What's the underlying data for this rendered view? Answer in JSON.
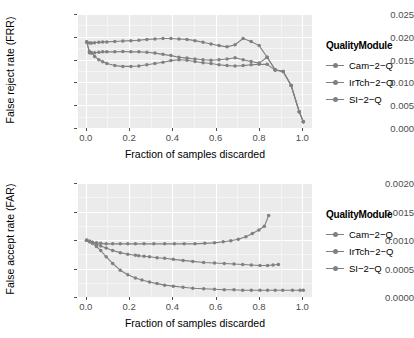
{
  "chart_data": [
    {
      "type": "line",
      "id": "frr-chart",
      "title": "",
      "xlabel": "Fraction of samples discarded",
      "ylabel": "False reject rate (FRR)",
      "xlim": [
        -0.04,
        1.04
      ],
      "ylim": [
        -0.0012,
        0.0262
      ],
      "xticks": [
        0.0,
        0.2,
        0.4,
        0.6,
        0.8,
        1.0
      ],
      "xticklabels": [
        "0.0",
        "0.2",
        "0.4",
        "0.6",
        "0.8",
        "1.0"
      ],
      "yticks": [
        0.0,
        0.005,
        0.01,
        0.015,
        0.02,
        0.025
      ],
      "yticklabels": [
        "0.000",
        "0.005",
        "0.010",
        "0.015",
        "0.020",
        "0.025"
      ],
      "grid": true,
      "legend_title": "QualityModule",
      "legend_position": "right",
      "series": [
        {
          "name": "Cam-2-Q",
          "color": "#808080",
          "x": [
            0.0,
            0.013,
            0.022,
            0.037,
            0.056,
            0.074,
            0.093,
            0.13,
            0.167,
            0.204,
            0.241,
            0.278,
            0.315,
            0.352,
            0.389,
            0.426,
            0.463,
            0.5,
            0.537,
            0.574,
            0.611,
            0.648,
            0.685,
            0.722,
            0.759,
            0.796,
            0.833,
            0.87,
            0.907,
            0.944,
            0.981,
            1.0
          ],
          "y": [
            0.0195,
            0.0172,
            0.0169,
            0.016,
            0.0152,
            0.0147,
            0.0143,
            0.0138,
            0.0136,
            0.0136,
            0.0137,
            0.014,
            0.0143,
            0.0146,
            0.015,
            0.0152,
            0.0151,
            0.0148,
            0.0145,
            0.0143,
            0.014,
            0.0138,
            0.0137,
            0.0138,
            0.014,
            0.0141,
            0.0141,
            0.0127,
            0.0124,
            0.009,
            0.0027,
            0.0003
          ]
        },
        {
          "name": "IrTch-2-Q",
          "color": "#808080",
          "x": [
            0.0,
            0.013,
            0.022,
            0.037,
            0.056,
            0.074,
            0.093,
            0.13,
            0.167,
            0.204,
            0.241,
            0.278,
            0.315,
            0.352,
            0.389,
            0.426,
            0.463,
            0.5,
            0.537,
            0.574,
            0.611,
            0.648,
            0.685,
            0.722,
            0.759,
            0.796,
            0.833,
            0.87,
            0.907,
            0.944,
            0.981,
            1.0
          ],
          "y": [
            0.0195,
            0.0169,
            0.0168,
            0.0169,
            0.017,
            0.0171,
            0.0171,
            0.0171,
            0.0172,
            0.0171,
            0.0171,
            0.017,
            0.0168,
            0.0165,
            0.0162,
            0.0158,
            0.0156,
            0.0154,
            0.0152,
            0.0151,
            0.0152,
            0.0154,
            0.0157,
            0.0152,
            0.0148,
            0.0144,
            0.0158,
            0.0128,
            0.0124,
            0.009,
            0.0027,
            0.0003
          ]
        },
        {
          "name": "SI-2-Q",
          "color": "#808080",
          "x": [
            0.0,
            0.013,
            0.022,
            0.037,
            0.056,
            0.074,
            0.093,
            0.13,
            0.167,
            0.204,
            0.241,
            0.278,
            0.315,
            0.352,
            0.389,
            0.426,
            0.463,
            0.5,
            0.537,
            0.574,
            0.611,
            0.648,
            0.685,
            0.722,
            0.759,
            0.796,
            0.833,
            0.87,
            0.907,
            0.944,
            0.981,
            1.0
          ],
          "y": [
            0.0195,
            0.0192,
            0.0192,
            0.0193,
            0.0194,
            0.0195,
            0.0195,
            0.0196,
            0.0197,
            0.0198,
            0.0199,
            0.0201,
            0.0202,
            0.0203,
            0.0203,
            0.0202,
            0.0201,
            0.0198,
            0.0194,
            0.019,
            0.0186,
            0.0183,
            0.0188,
            0.0203,
            0.0196,
            0.0186,
            0.0158,
            0.0128,
            0.0124,
            0.009,
            0.0027,
            0.0003
          ]
        }
      ]
    },
    {
      "type": "line",
      "id": "far-chart",
      "title": "",
      "xlabel": "Fraction of samples discarded",
      "ylabel": "False accept rate (FAR)",
      "xlim": [
        -0.04,
        1.04
      ],
      "ylim": [
        -0.0001,
        0.00211
      ],
      "xticks": [
        0.0,
        0.2,
        0.4,
        0.6,
        0.8,
        1.0
      ],
      "xticklabels": [
        "0.0",
        "0.2",
        "0.4",
        "0.6",
        "0.8",
        "1.0"
      ],
      "yticks": [
        0.0,
        0.0005,
        0.001,
        0.0015,
        0.002
      ],
      "yticklabels": [
        "0.0000",
        "0.0005",
        "0.0010",
        "0.0015",
        "0.0020"
      ],
      "grid": true,
      "legend_title": "QualityModule",
      "legend_position": "right",
      "series": [
        {
          "name": "Cam-2-Q",
          "color": "#808080",
          "x": [
            0.0,
            0.013,
            0.026,
            0.045,
            0.065,
            0.09,
            0.12,
            0.155,
            0.19,
            0.225,
            0.255,
            0.29,
            0.325,
            0.36,
            0.4,
            0.445,
            0.49,
            0.54,
            0.59,
            0.635,
            0.68,
            0.72,
            0.76,
            0.8,
            0.835,
            0.87,
            0.905,
            0.95,
            0.985,
            1.0
          ],
          "y": [
            0.001,
            0.00097,
            0.00094,
            0.00088,
            0.0008,
            0.00068,
            0.00055,
            0.00042,
            0.00033,
            0.00027,
            0.00023,
            0.00019,
            0.00016,
            0.00013,
            0.00011,
            9e-05,
            7e-05,
            6e-05,
            5e-05,
            4e-05,
            4e-05,
            3e-05,
            3e-05,
            3e-05,
            3e-05,
            3e-05,
            3e-05,
            3e-05,
            3e-05,
            3e-05
          ]
        },
        {
          "name": "IrTch-2-Q",
          "color": "#808080",
          "x": [
            0.0,
            0.013,
            0.026,
            0.045,
            0.065,
            0.09,
            0.12,
            0.155,
            0.19,
            0.225,
            0.24,
            0.265,
            0.29,
            0.325,
            0.36,
            0.4,
            0.445,
            0.49,
            0.54,
            0.59,
            0.635,
            0.68,
            0.72,
            0.76,
            0.8,
            0.835,
            0.86,
            0.885
          ],
          "y": [
            0.001,
            0.00098,
            0.00096,
            0.00093,
            0.00089,
            0.00085,
            0.0008,
            0.00076,
            0.00073,
            0.00071,
            0.0007,
            0.00069,
            0.00068,
            0.00066,
            0.00065,
            0.00063,
            0.00061,
            0.00059,
            0.00057,
            0.00056,
            0.00055,
            0.00054,
            0.00053,
            0.00052,
            0.00051,
            0.00051,
            0.00052,
            0.00053
          ]
        },
        {
          "name": "SI-2-Q",
          "color": "#808080",
          "x": [
            0.0,
            0.013,
            0.026,
            0.045,
            0.065,
            0.09,
            0.12,
            0.155,
            0.19,
            0.225,
            0.265,
            0.31,
            0.36,
            0.405,
            0.45,
            0.5,
            0.545,
            0.59,
            0.63,
            0.665,
            0.7,
            0.735,
            0.765,
            0.795,
            0.82,
            0.84
          ],
          "y": [
            0.001,
            0.00098,
            0.00096,
            0.00095,
            0.00094,
            0.00093,
            0.00093,
            0.00093,
            0.00093,
            0.00093,
            0.00093,
            0.00093,
            0.00093,
            0.00093,
            0.00093,
            0.00093,
            0.00094,
            0.00095,
            0.00097,
            0.00099,
            0.00102,
            0.00107,
            0.00113,
            0.0012,
            0.00127,
            0.00148
          ]
        }
      ]
    }
  ],
  "top_chart": {
    "ylabel": "False reject rate (FRR)",
    "xlabel": "Fraction of samples discarded",
    "yticklabels": [
      "0.025",
      "0.020",
      "0.015",
      "0.010",
      "0.005",
      "0.000"
    ],
    "xticklabels": [
      "0.0",
      "0.2",
      "0.4",
      "0.6",
      "0.8",
      "1.0"
    ],
    "legend": {
      "title": "QualityModule",
      "items": [
        {
          "label": "Cam−2−Q"
        },
        {
          "label": "IrTch−2−Q"
        },
        {
          "label": "SI−2−Q"
        }
      ]
    }
  },
  "bottom_chart": {
    "ylabel": "False accept rate (FAR)",
    "xlabel": "Fraction of samples discarded",
    "yticklabels": [
      "0.0020",
      "0.0015",
      "0.0010",
      "0.0005",
      "0.0000"
    ],
    "xticklabels": [
      "0.0",
      "0.2",
      "0.4",
      "0.6",
      "0.8",
      "1.0"
    ],
    "legend": {
      "title": "QualityModule",
      "items": [
        {
          "label": "Cam−2−Q"
        },
        {
          "label": "IrTch−2−Q"
        },
        {
          "label": "SI−2−Q"
        }
      ]
    }
  }
}
